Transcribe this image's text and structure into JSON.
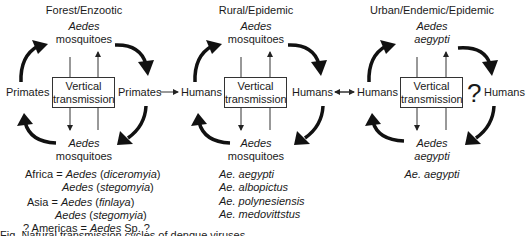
{
  "panels": [
    {
      "title": "Forest/Enzootic",
      "top_vector": {
        "line1": "Aedes",
        "line2": "mosquitoes"
      },
      "bottom_vector": {
        "line1": "Aedes",
        "line2": "mosquitoes"
      },
      "left_host": "Primates",
      "right_host": "Primates",
      "box": {
        "line1": "Vertical",
        "line2": "transmission"
      },
      "species": [
        {
          "prefix": "Africa = ",
          "genus": "Aedes",
          "sub": "diceromyia"
        },
        {
          "prefix": "",
          "genus": "Aedes",
          "sub": "stegomyia"
        },
        {
          "prefix": "Asia = ",
          "genus": "Aedes",
          "sub": "finlaya"
        },
        {
          "prefix": "",
          "genus": "Aedes",
          "sub": "stegomyia"
        },
        {
          "prefix": "? Americas = ",
          "genus": "Aedes",
          "suffix": " Sp. ?"
        }
      ]
    },
    {
      "title": "Rural/Epidemic",
      "top_vector": {
        "line1": "Aedes",
        "line2": "mosquitoes"
      },
      "bottom_vector": {
        "line1": "Aedes",
        "line2": "mosquitoes"
      },
      "left_host": "Humans",
      "right_host": "Humans",
      "box": {
        "line1": "Vertical",
        "line2": "transmission"
      },
      "species": [
        "Ae. aegypti",
        "Ae. albopictus",
        "Ae. polynesiensis",
        "Ae. medovittstus"
      ]
    },
    {
      "title": "Urban/Endemic/Epidemic",
      "top_vector": {
        "line1": "Aedes",
        "line2": "aegypti"
      },
      "bottom_vector": {
        "line1": "Aedes",
        "line2": "aegypti"
      },
      "left_host": "Humans",
      "right_host": "Humans",
      "uncertain_mark": "?",
      "box": {
        "line1": "Vertical",
        "line2": "transmission"
      },
      "species": [
        "Ae. aegypti"
      ]
    }
  ],
  "connectors": [
    {
      "from": "Primates",
      "to": "Humans",
      "type": "one-way"
    },
    {
      "from": "Humans",
      "to": "Humans",
      "type": "two-way"
    }
  ],
  "caption": "Fig. Natural transmission cycles of dengue viruses"
}
